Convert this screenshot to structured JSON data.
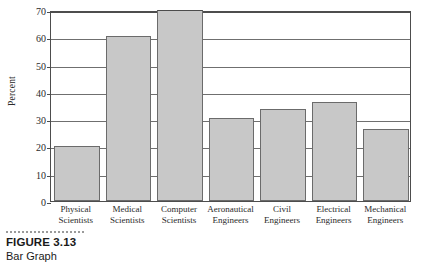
{
  "figure": {
    "number_label": "FIGURE 3.13",
    "title": "Bar Graph"
  },
  "chart_data": {
    "type": "bar",
    "title": "",
    "xlabel": "",
    "ylabel": "Percent",
    "ylim": [
      0,
      70
    ],
    "ytick_values": [
      0,
      10,
      20,
      30,
      40,
      50,
      60,
      70
    ],
    "ytick_labels": [
      "0",
      "10",
      "20",
      "30",
      "40",
      "50",
      "60",
      "70"
    ],
    "grid": true,
    "legend": "none",
    "bar_color": "#c8c8c8",
    "bar_edge_color": "#6b6b6b",
    "categories": [
      "Physical Scientists",
      "Medical Scientists",
      "Computer Scientists",
      "Aeronautical Engineers",
      "Civil Engineers",
      "Electrical Engineers",
      "Mechanical Engineers"
    ],
    "category_lines": [
      [
        "Physical",
        "Scientists"
      ],
      [
        "Medical",
        "Scientists"
      ],
      [
        "Computer",
        "Scientists"
      ],
      [
        "Aeronautical",
        "Engineers"
      ],
      [
        "Civil",
        "Engineers"
      ],
      [
        "Electrical",
        "Engineers"
      ],
      [
        "Mechanical",
        "Engineers"
      ]
    ],
    "values": [
      20,
      60.3,
      70.8,
      30.5,
      33.7,
      36.4,
      26.4
    ]
  }
}
